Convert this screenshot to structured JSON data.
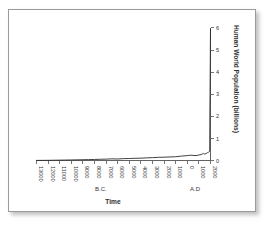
{
  "figure": {
    "background_color": "#ffffff",
    "frame_color": "#9a9a9a",
    "line_color": "#2b2b2b"
  },
  "chart_data": {
    "type": "line",
    "title": "",
    "subtitle": "",
    "xlabel": "Time",
    "ylabel": "Human World Population (billions)",
    "ylabel_position": "right",
    "grid": false,
    "legend": null,
    "xlim": [
      -13000,
      2000
    ],
    "ylim": [
      0,
      6.2
    ],
    "y_ticks": [
      0,
      1,
      2,
      3,
      4,
      5,
      6
    ],
    "y_tick_labels": [
      "0",
      "1",
      "2",
      "3",
      "4",
      "5",
      "6"
    ],
    "x_ticks": [
      -13000,
      -12000,
      -11000,
      -10000,
      -9000,
      -8000,
      -7000,
      -6000,
      -5000,
      -4000,
      -3000,
      -2000,
      -1000,
      0,
      1000,
      2000
    ],
    "x_tick_labels": [
      "13000",
      "12000",
      "11000",
      "10000",
      "9000",
      "8000",
      "7000",
      "6000",
      "5000",
      "4000",
      "3000",
      "2000",
      "1000",
      "0",
      "1000",
      "2000"
    ],
    "x_tick_labels_rotated": true,
    "era_annotations": [
      {
        "text": "B.C.",
        "x": -6500
      },
      {
        "text": "A.D",
        "x": 1000
      }
    ],
    "x": [
      -13000,
      -12500,
      -12000,
      -11500,
      -11000,
      -10500,
      -10000,
      -9500,
      -9000,
      -8500,
      -8000,
      -7500,
      -7000,
      -6500,
      -6000,
      -5500,
      -5000,
      -4500,
      -4000,
      -3500,
      -3000,
      -2500,
      -2000,
      -1500,
      -1000,
      -500,
      0,
      250,
      500,
      750,
      1000,
      1200,
      1400,
      1500,
      1600,
      1700,
      1750,
      1800,
      1850,
      1900,
      1930,
      1950,
      1960,
      1970,
      1980,
      1990,
      2000
    ],
    "values": [
      0.004,
      0.006,
      0.008,
      0.012,
      0.016,
      0.02,
      0.025,
      0.03,
      0.035,
      0.04,
      0.047,
      0.055,
      0.062,
      0.075,
      0.068,
      0.085,
      0.09,
      0.1,
      0.105,
      0.12,
      0.13,
      0.145,
      0.15,
      0.16,
      0.17,
      0.2,
      0.22,
      0.24,
      0.23,
      0.22,
      0.25,
      0.27,
      0.32,
      0.29,
      0.31,
      0.34,
      0.36,
      0.37,
      0.38,
      0.4,
      0.42,
      2.5,
      3.0,
      3.7,
      4.4,
      5.3,
      5.95
    ],
    "peak_value": 6.0,
    "annotation_note": "Population is near-flat from 13000 B.C. until a sharp near-vertical rise at A.D. 2000."
  }
}
